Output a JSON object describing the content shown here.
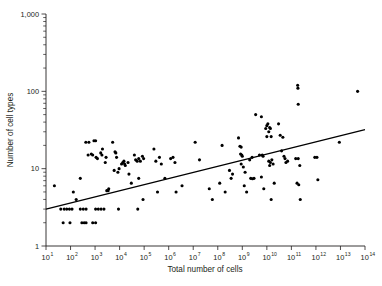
{
  "chart_data": {
    "type": "scatter",
    "title": "",
    "xlabel": "Total number of cells",
    "ylabel": "Number of cell types",
    "xscale": "log",
    "yscale": "log",
    "xlim": [
      10,
      100000000000000
    ],
    "ylim": [
      1,
      1000
    ],
    "grid": false,
    "legend": null,
    "x_tick_labels": [
      "10¹",
      "10²",
      "10³",
      "10⁴",
      "10⁵",
      "10⁶",
      "10⁷",
      "10⁸",
      "10⁹",
      "10¹⁰",
      "10¹¹",
      "10¹²",
      "10¹³",
      "10¹⁴"
    ],
    "x_tick_bases": [
      "10",
      "10",
      "10",
      "10",
      "10",
      "10",
      "10",
      "10",
      "10",
      "10",
      "10",
      "10",
      "10",
      "10"
    ],
    "x_tick_exponents": [
      "1",
      "2",
      "3",
      "4",
      "5",
      "6",
      "7",
      "8",
      "9",
      "10",
      "11",
      "12",
      "13",
      "14"
    ],
    "x_tick_values": [
      10,
      100,
      1000,
      10000,
      100000,
      1000000,
      10000000,
      100000000,
      1000000000,
      10000000000,
      100000000000,
      1000000000000,
      10000000000000,
      100000000000000
    ],
    "y_tick_labels": [
      "1",
      "10",
      "100",
      "1,000"
    ],
    "y_tick_values": [
      1,
      10,
      100,
      1000
    ],
    "point_color": "#000000",
    "line_color": "#000000",
    "axis_color": "#231f20",
    "fit_line": {
      "x1": 10,
      "y1": 3.0,
      "x2": 100000000000000,
      "y2": 32.0
    },
    "points": [
      [
        22,
        6.0
      ],
      [
        40,
        3.0
      ],
      [
        55,
        3.0
      ],
      [
        70,
        3.0
      ],
      [
        90,
        3.0
      ],
      [
        115,
        3.0
      ],
      [
        250,
        3.0
      ],
      [
        330,
        3.0
      ],
      [
        430,
        3.0
      ],
      [
        1050,
        3.0
      ],
      [
        1350,
        3.0
      ],
      [
        1750,
        3.0
      ],
      [
        2300,
        3.0
      ],
      [
        9000,
        3.0
      ],
      [
        55000,
        3.0
      ],
      [
        50,
        2.0
      ],
      [
        95,
        2.0
      ],
      [
        290,
        2.0
      ],
      [
        360,
        2.0
      ],
      [
        430,
        2.0
      ],
      [
        800,
        2.0
      ],
      [
        1050,
        2.0
      ],
      [
        130,
        5.0
      ],
      [
        170,
        4.0
      ],
      [
        250,
        7.5
      ],
      [
        420,
        22.0
      ],
      [
        560,
        22.0
      ],
      [
        900,
        23.0
      ],
      [
        1050,
        23.0
      ],
      [
        520,
        15.0
      ],
      [
        700,
        15.5
      ],
      [
        800,
        15.0
      ],
      [
        1100,
        14.0
      ],
      [
        1250,
        13.5
      ],
      [
        1700,
        16.0
      ],
      [
        1900,
        15.0
      ],
      [
        2000,
        18.0
      ],
      [
        2600,
        12.0
      ],
      [
        2800,
        14.0
      ],
      [
        3000,
        5.2
      ],
      [
        3400,
        5.2
      ],
      [
        3600,
        5.5
      ],
      [
        5200,
        22.0
      ],
      [
        6500,
        16.5
      ],
      [
        7000,
        16.0
      ],
      [
        7500,
        14.0
      ],
      [
        6000,
        9.5
      ],
      [
        8500,
        9.0
      ],
      [
        9500,
        10.0
      ],
      [
        12000,
        11.5
      ],
      [
        13500,
        12.0
      ],
      [
        15000,
        12.5
      ],
      [
        16000,
        11.5
      ],
      [
        17000,
        11.0
      ],
      [
        22000,
        12.0
      ],
      [
        24000,
        8.5
      ],
      [
        30000,
        6.5
      ],
      [
        40000,
        15.0
      ],
      [
        45000,
        13.0
      ],
      [
        52000,
        12.5
      ],
      [
        60000,
        13.5
      ],
      [
        70000,
        12.5
      ],
      [
        85000,
        14.5
      ],
      [
        95000,
        13.5
      ],
      [
        60000,
        7.5
      ],
      [
        90000,
        4.0
      ],
      [
        250000,
        18.0
      ],
      [
        300000,
        12.5
      ],
      [
        420000,
        14.0
      ],
      [
        500000,
        11.5
      ],
      [
        350000,
        5.0
      ],
      [
        700000,
        7.5
      ],
      [
        1200000,
        13.5
      ],
      [
        1500000,
        14.0
      ],
      [
        1800000,
        12.0
      ],
      [
        2000000,
        5.0
      ],
      [
        3500000,
        6.0
      ],
      [
        12000000,
        22.0
      ],
      [
        18000000,
        13.0
      ],
      [
        45000000,
        5.5
      ],
      [
        60000000,
        4.0
      ],
      [
        120000000,
        6.5
      ],
      [
        150000000,
        20.0
      ],
      [
        200000000,
        5.0
      ],
      [
        300000000,
        9.5
      ],
      [
        350000000,
        7.5
      ],
      [
        400000000,
        8.5
      ],
      [
        700000000,
        25.0
      ],
      [
        800000000,
        19.5
      ],
      [
        900000000,
        19.0
      ],
      [
        850000000,
        15.5
      ],
      [
        950000000,
        15.0
      ],
      [
        1000000000,
        14.5
      ],
      [
        900000000,
        11.5
      ],
      [
        1100000000,
        10.5
      ],
      [
        1300000000,
        9.0
      ],
      [
        1200000000,
        6.0
      ],
      [
        1500000000,
        5.0
      ],
      [
        2000000000,
        13.0
      ],
      [
        2500000000,
        14.0
      ],
      [
        2200000000,
        7.5
      ],
      [
        2600000000,
        7.4
      ],
      [
        3000000000,
        7.5
      ],
      [
        3500000000,
        50.0
      ],
      [
        6000000000,
        47.0
      ],
      [
        5000000000,
        15.0
      ],
      [
        6500000000,
        15.0
      ],
      [
        7000000000,
        14.5
      ],
      [
        6000000000,
        7.8
      ],
      [
        7500000000,
        5.5
      ],
      [
        9000000000,
        33.0
      ],
      [
        10000000000,
        36.0
      ],
      [
        11000000000,
        38.0
      ],
      [
        12000000000,
        30.0
      ],
      [
        13000000000,
        34.0
      ],
      [
        14000000000,
        33.0
      ],
      [
        10000000000,
        26.0
      ],
      [
        15000000000,
        26.0
      ],
      [
        12000000000,
        12.5
      ],
      [
        14000000000,
        12.0
      ],
      [
        16000000000,
        13.0
      ],
      [
        13000000000,
        11.0
      ],
      [
        18000000000,
        11.5
      ],
      [
        15000000000,
        4.0
      ],
      [
        20000000000,
        6.5
      ],
      [
        30000000000,
        38.0
      ],
      [
        35000000000,
        27.0
      ],
      [
        45000000000,
        25.5
      ],
      [
        40000000000,
        17.0
      ],
      [
        50000000000,
        14.5
      ],
      [
        55000000000,
        13.5
      ],
      [
        60000000000,
        12.0
      ],
      [
        70000000000,
        12.5
      ],
      [
        180000000000,
        120.0
      ],
      [
        185000000000,
        110.0
      ],
      [
        190000000000,
        68.0
      ],
      [
        150000000000,
        13.5
      ],
      [
        190000000000,
        13.5
      ],
      [
        220000000000,
        11.0
      ],
      [
        170000000000,
        6.5
      ],
      [
        200000000000,
        6.2
      ],
      [
        230000000000,
        4.0
      ],
      [
        900000000000,
        14.0
      ],
      [
        1100000000000,
        14.0
      ],
      [
        1200000000000,
        7.2
      ],
      [
        9000000000000,
        22.0
      ],
      [
        50000000000000,
        100.0
      ]
    ]
  }
}
